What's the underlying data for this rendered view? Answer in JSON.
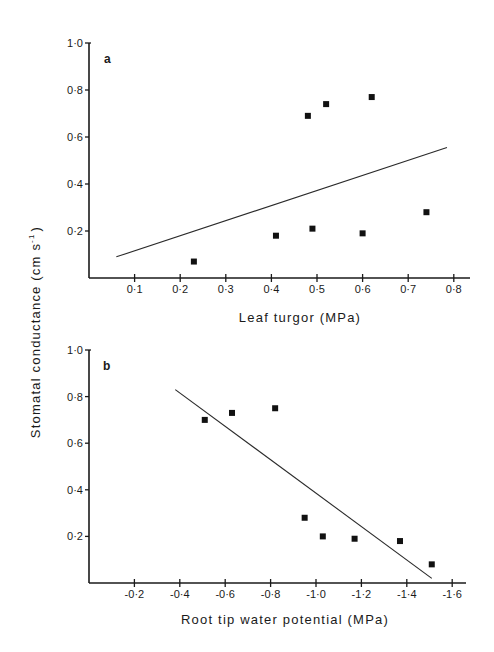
{
  "figure": {
    "ylabel": "Stomatal conductance (cm s⁻¹)",
    "ylabel_main": "Stomatal conductance (cm s",
    "ylabel_sup": "-1",
    "ylabel_close": ")"
  },
  "chart_data": [
    {
      "type": "scatter",
      "panel": "a",
      "title": "",
      "xlabel": "Leaf turgor (MPa)",
      "ylabel": "Stomatal conductance (cm s⁻¹)",
      "xlim": [
        0,
        0.83
      ],
      "ylim": [
        0,
        1.0
      ],
      "xticks": [
        "0·1",
        "0·2",
        "0·3",
        "0·4",
        "0·5",
        "0·6",
        "0·7",
        "0·8"
      ],
      "xtick_values": [
        0.1,
        0.2,
        0.3,
        0.4,
        0.5,
        0.6,
        0.7,
        0.8
      ],
      "yticks": [
        "0·2",
        "0·4",
        "0·6",
        "0·8",
        "1·0"
      ],
      "ytick_values": [
        0.2,
        0.4,
        0.6,
        0.8,
        1.0
      ],
      "grid": false,
      "series": [
        {
          "name": "observations",
          "marker": "square",
          "x": [
            0.23,
            0.41,
            0.48,
            0.49,
            0.52,
            0.6,
            0.62,
            0.74
          ],
          "y": [
            0.07,
            0.18,
            0.69,
            0.21,
            0.74,
            0.19,
            0.77,
            0.28
          ]
        }
      ],
      "regression_line": {
        "x": [
          0.06,
          0.785
        ],
        "y": [
          0.09,
          0.555
        ]
      }
    },
    {
      "type": "scatter",
      "panel": "b",
      "title": "",
      "xlabel": "Root tip water potential (MPa)",
      "ylabel": "Stomatal conductance (cm s⁻¹)",
      "xlim": [
        0,
        -1.67
      ],
      "ylim": [
        0,
        1.0
      ],
      "xticks": [
        "-0·2",
        "-0·4",
        "-0·6",
        "-0·8",
        "-1·0",
        "-1·2",
        "-1·4",
        "-1·6"
      ],
      "xtick_values": [
        -0.2,
        -0.4,
        -0.6,
        -0.8,
        -1.0,
        -1.2,
        -1.4,
        -1.6
      ],
      "yticks": [
        "0·2",
        "0·4",
        "0·6",
        "0·8",
        "1·0"
      ],
      "ytick_values": [
        0.2,
        0.4,
        0.6,
        0.8,
        1.0
      ],
      "grid": false,
      "series": [
        {
          "name": "observations",
          "marker": "square",
          "x": [
            -0.51,
            -0.63,
            -0.82,
            -0.95,
            -1.03,
            -1.17,
            -1.37,
            -1.51
          ],
          "y": [
            0.7,
            0.73,
            0.75,
            0.28,
            0.2,
            0.19,
            0.18,
            0.08
          ]
        }
      ],
      "regression_line": {
        "x": [
          -0.38,
          -1.51
        ],
        "y": [
          0.83,
          0.02
        ]
      }
    }
  ]
}
